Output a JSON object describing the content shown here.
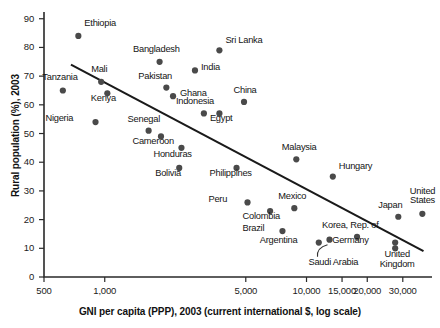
{
  "chart_data": {
    "type": "scatter",
    "title": "",
    "xlabel": "GNI per capita (PPP), 2003 (current international $, log scale)",
    "ylabel": "Rural population (%), 2003",
    "x_scale": "log",
    "xlim": [
      500,
      40000
    ],
    "ylim": [
      0,
      92
    ],
    "grid": false,
    "legend": "none",
    "x_ticks": [
      {
        "value": 500,
        "label": "500"
      },
      {
        "value": 1000,
        "label": "1,000"
      },
      {
        "value": 5000,
        "label": "5,000"
      },
      {
        "value": 10000,
        "label": "10,000"
      },
      {
        "value": 15000,
        "label": "15,000"
      },
      {
        "value": 20000,
        "label": "20,000"
      },
      {
        "value": 30000,
        "label": "30,000"
      }
    ],
    "y_ticks": [
      {
        "value": 0,
        "label": "0"
      },
      {
        "value": 10,
        "label": "10"
      },
      {
        "value": 20,
        "label": "20"
      },
      {
        "value": 30,
        "label": "30"
      },
      {
        "value": 40,
        "label": "40"
      },
      {
        "value": 50,
        "label": "50"
      },
      {
        "value": 60,
        "label": "60"
      },
      {
        "value": 70,
        "label": "70"
      },
      {
        "value": 80,
        "label": "80"
      },
      {
        "value": 90,
        "label": "90"
      }
    ],
    "points": [
      {
        "name": "Ethiopia",
        "x": 740,
        "y": 84,
        "label_dx": 6,
        "label_dy": -13,
        "align": "left"
      },
      {
        "name": "Tanzania",
        "x": 620,
        "y": 65,
        "label_dx": -3,
        "label_dy": -13,
        "align": "center"
      },
      {
        "name": "Mali",
        "x": 960,
        "y": 68,
        "label_dx": -2,
        "label_dy": -13,
        "align": "center"
      },
      {
        "name": "Kenya",
        "x": 1030,
        "y": 64,
        "label_dx": -4,
        "label_dy": 5,
        "align": "center"
      },
      {
        "name": "Nigeria",
        "x": 900,
        "y": 54,
        "label_dx": -22,
        "label_dy": -4,
        "align": "right"
      },
      {
        "name": "Bangladesh",
        "x": 1870,
        "y": 75,
        "label_dx": -3,
        "label_dy": -13,
        "align": "center"
      },
      {
        "name": "Pakistan",
        "x": 2020,
        "y": 66,
        "label_dx": -11,
        "label_dy": -12,
        "align": "center"
      },
      {
        "name": "Ghana",
        "x": 2180,
        "y": 63,
        "label_dx": 7,
        "label_dy": -3,
        "align": "left"
      },
      {
        "name": "Senegal",
        "x": 1650,
        "y": 51,
        "label_dx": -5,
        "label_dy": -12,
        "align": "center"
      },
      {
        "name": "Cameroon",
        "x": 1900,
        "y": 49,
        "label_dx": -8,
        "label_dy": 5,
        "align": "center"
      },
      {
        "name": "Honduras",
        "x": 2400,
        "y": 45,
        "label_dx": -9,
        "label_dy": 6,
        "align": "center"
      },
      {
        "name": "Bolivia",
        "x": 2340,
        "y": 38,
        "label_dx": -11,
        "label_dy": 5,
        "align": "center"
      },
      {
        "name": "India",
        "x": 2800,
        "y": 72,
        "label_dx": 6,
        "label_dy": -3,
        "align": "left"
      },
      {
        "name": "Indonesia",
        "x": 3100,
        "y": 57,
        "label_dx": -9,
        "label_dy": -12,
        "align": "center"
      },
      {
        "name": "Sri Lanka",
        "x": 3700,
        "y": 79,
        "label_dx": 6,
        "label_dy": -10,
        "align": "left"
      },
      {
        "name": "Egypt",
        "x": 3700,
        "y": 57,
        "label_dx": 2,
        "label_dy": 5,
        "align": "center"
      },
      {
        "name": "China",
        "x": 4900,
        "y": 61,
        "label_dx": 1,
        "label_dy": -12,
        "align": "center"
      },
      {
        "name": "Philippines",
        "x": 4500,
        "y": 38,
        "label_dx": -6,
        "label_dy": 5,
        "align": "center"
      },
      {
        "name": "Malaysia",
        "x": 8900,
        "y": 41,
        "label_dx": 3,
        "label_dy": -12,
        "align": "center"
      },
      {
        "name": "Hungary",
        "x": 13500,
        "y": 35,
        "label_dx": 6,
        "label_dy": -11,
        "align": "left"
      },
      {
        "name": "Peru",
        "x": 5100,
        "y": 26,
        "label_dx": -20,
        "label_dy": -3,
        "align": "right"
      },
      {
        "name": "Colombia",
        "x": 6600,
        "y": 23,
        "label_dx": -9,
        "label_dy": 5,
        "align": "center"
      },
      {
        "name": "Mexico",
        "x": 8700,
        "y": 24,
        "label_dx": -2,
        "label_dy": -12,
        "align": "center"
      },
      {
        "name": "Brazil",
        "x": 7600,
        "y": 16,
        "label_dx": -18,
        "label_dy": -3,
        "align": "right"
      },
      {
        "name": "Argentina",
        "x": 11500,
        "y": 12,
        "label_dx": -21,
        "label_dy": -3,
        "align": "right"
      },
      {
        "name": "Saudi Arabia",
        "x": 13000,
        "y": 13,
        "label_dx": 4,
        "label_dy": 22,
        "align": "center"
      },
      {
        "name": "Korea, Rep. of",
        "x": 17800,
        "y": 14,
        "label_dx": -7,
        "label_dy": -12,
        "align": "center"
      },
      {
        "name": "Germany",
        "x": 27500,
        "y": 12,
        "label_dx": -27,
        "label_dy": -3,
        "align": "right"
      },
      {
        "name": "United Kingdom",
        "x": 27500,
        "y": 10,
        "label_dx": 2,
        "label_dy": 6,
        "align": "center",
        "lines": [
          "United",
          "Kingdom"
        ]
      },
      {
        "name": "Japan",
        "x": 28500,
        "y": 21,
        "label_dx": -8,
        "label_dy": -12,
        "align": "center"
      },
      {
        "name": "United States",
        "x": 37500,
        "y": 22,
        "label_dx": 0,
        "label_dy": -23,
        "align": "center",
        "lines": [
          "United",
          "States"
        ]
      }
    ],
    "trend_line": {
      "x1": 680,
      "y1": 74,
      "x2": 38000,
      "y2": 9
    },
    "annotation_leader": {
      "from": "Argentina label area",
      "to": "Saudi Arabia point"
    }
  },
  "colors": {
    "dot": "#4a4a4a",
    "axis": "#2a2a2a",
    "trend": "#1a1a1a",
    "text": "#141414",
    "background": "#ffffff"
  }
}
